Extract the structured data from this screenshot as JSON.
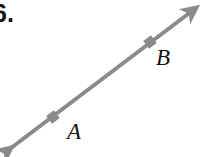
{
  "figure": {
    "problem_number": "6.",
    "background_color": "#ffffff",
    "line_color": "#8a8a8a",
    "label_color": "#111111",
    "line": {
      "name": "line-AB",
      "description": "double-headed arrow through points A and B",
      "stroke_width": 4,
      "start_x": 6,
      "start_y": 152,
      "end_x": 201,
      "end_y": 4,
      "arrow_start": "arrowhead-down-left",
      "arrow_end": "arrowhead-up-right"
    },
    "points": [
      {
        "label": "A",
        "marker_x": 53,
        "marker_y": 117,
        "label_x": 67,
        "label_y": 120
      },
      {
        "label": "B",
        "marker_x": 150,
        "marker_y": 42,
        "label_x": 156,
        "label_y": 46
      }
    ]
  }
}
